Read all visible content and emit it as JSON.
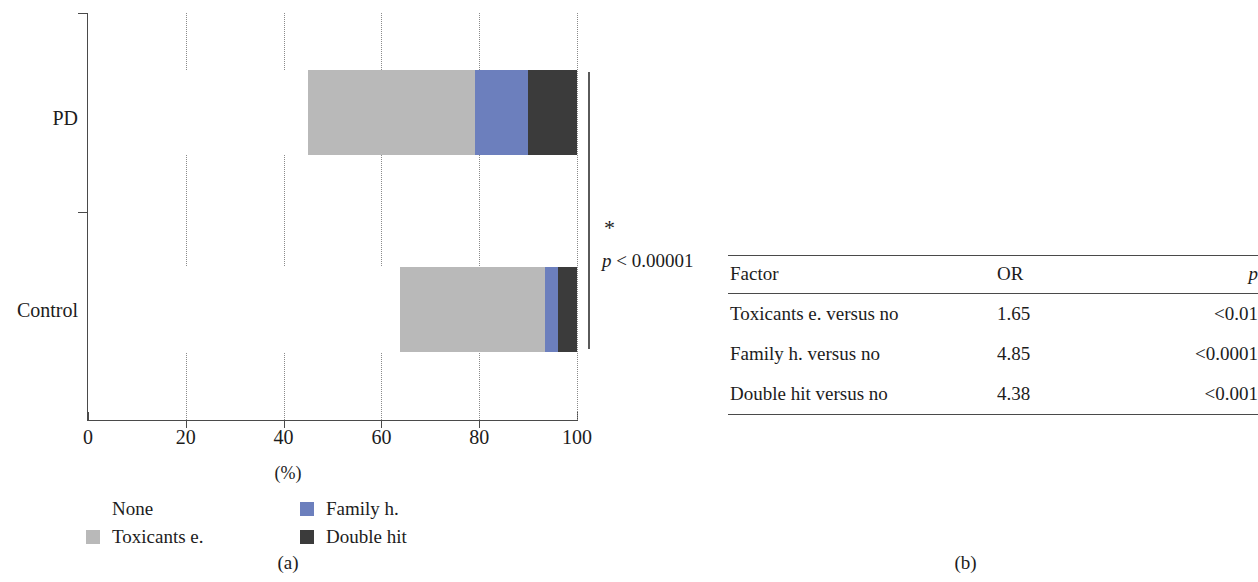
{
  "figure": {
    "panel_a_caption": "(a)",
    "panel_b_caption": "(b)"
  },
  "chart_data": {
    "type": "bar",
    "orientation": "horizontal",
    "stacked": true,
    "title": "",
    "xlabel": "(%)",
    "ylabel": "",
    "xlim": [
      0,
      100
    ],
    "xticks": [
      0,
      20,
      40,
      60,
      80,
      100
    ],
    "xtick_labels": [
      "0",
      "20",
      "40",
      "60",
      "80",
      "100"
    ],
    "categories": [
      "PD",
      "Control"
    ],
    "grid": "dotted vertical gridlines at each x tick",
    "legend_position": "below axes, two columns",
    "series": [
      {
        "name": "None",
        "color": "#ffffff",
        "values": [
          45.0,
          63.8
        ]
      },
      {
        "name": "Toxicants e.",
        "color": "#b9b9b9",
        "values": [
          34.1,
          29.7
        ]
      },
      {
        "name": "Family h.",
        "color": "#6c7fbd",
        "values": [
          10.8,
          2.7
        ]
      },
      {
        "name": "Double hit",
        "color": "#3b3b3b",
        "values": [
          10.1,
          3.8
        ]
      }
    ],
    "annotations": [
      {
        "text": "*",
        "kind": "significance-star"
      },
      {
        "text": "p < 0.00001",
        "kind": "significance-p-value"
      }
    ]
  },
  "chart": {
    "axis_title": "(%)",
    "ticks": [
      "0",
      "20",
      "40",
      "60",
      "80",
      "100"
    ],
    "category_labels": [
      "PD",
      "Control"
    ],
    "significance": {
      "star": "*",
      "p_text_italic": "p",
      "p_text_rest": " < 0.00001"
    },
    "legend": [
      {
        "label": "None",
        "color": "#ffffff",
        "icon": "legend-swatch-none"
      },
      {
        "label": "Family h.",
        "color": "#6c7fbd",
        "icon": "legend-swatch-family-h"
      },
      {
        "label": "Toxicants e.",
        "color": "#b9b9b9",
        "icon": "legend-swatch-toxicants-e"
      },
      {
        "label": "Double hit",
        "color": "#3b3b3b",
        "icon": "legend-swatch-double-hit"
      }
    ]
  },
  "table": {
    "headers": [
      "Factor",
      "OR",
      "p"
    ],
    "header_p_italic": "p",
    "rows": [
      {
        "factor": "Toxicants e. versus no",
        "or": "1.65",
        "p": "<0.01"
      },
      {
        "factor": "Family h. versus no",
        "or": "4.85",
        "p": "<0.0001"
      },
      {
        "factor": "Double hit versus no",
        "or": "4.38",
        "p": "<0.001"
      }
    ]
  }
}
